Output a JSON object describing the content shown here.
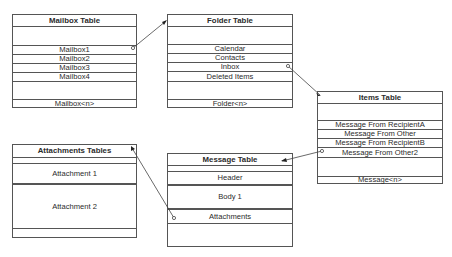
{
  "diagram": {
    "tables": {
      "mailbox": {
        "title": "Mailbox Table",
        "rows": [
          "",
          "Mailbox1",
          "Mailbox2",
          "Mailbox3",
          "Mailbox4",
          "",
          "Mailbox<n>"
        ]
      },
      "folder": {
        "title": "Folder Table",
        "rows": [
          "",
          "Calendar",
          "Contacts",
          "Inbox",
          "Deleted Items",
          "",
          "Folder<n>"
        ]
      },
      "items": {
        "title": "Items Table",
        "rows": [
          "",
          "Message From RecipientA",
          "Message From Other",
          "Message From RecipientB",
          "Message From Other2",
          "",
          "Message<n>"
        ]
      },
      "message": {
        "title": "Message Table",
        "rows": [
          "",
          "Header",
          "Body 1",
          "Attachments",
          ""
        ]
      },
      "attachments": {
        "title": "Attachments Tables",
        "rows": [
          "",
          "Attachment 1",
          "Attachment 2",
          ""
        ]
      }
    },
    "connections": [
      {
        "from": "Mailbox Table: Mailbox1",
        "to": "Folder Table"
      },
      {
        "from": "Folder Table: Inbox",
        "to": "Items Table"
      },
      {
        "from": "Items Table: Message From Other2",
        "to": "Message Table"
      },
      {
        "from": "Message Table: Attachments",
        "to": "Attachments Tables"
      }
    ],
    "colors": {
      "border": "#555555",
      "line": "#444444",
      "text": "#2b2b2b",
      "background": "#ffffff"
    }
  }
}
